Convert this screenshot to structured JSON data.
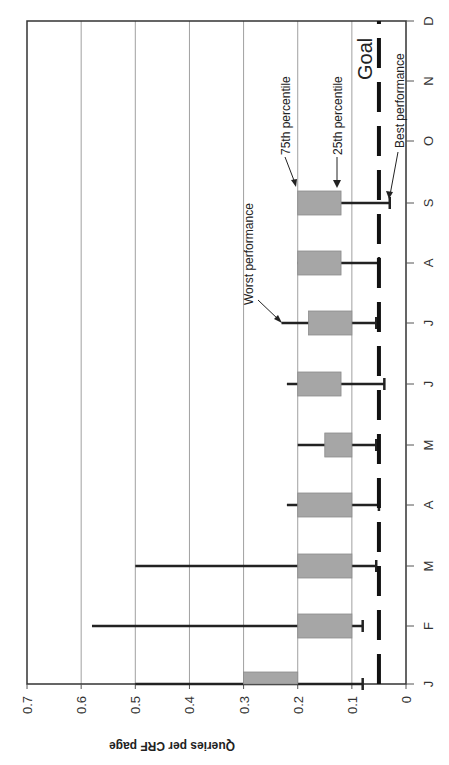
{
  "chart_data": {
    "type": "box",
    "orientation": "rotated-90-clockwise",
    "title": "",
    "xlabel": "",
    "ylabel": "Queries per CRF page",
    "ylim": [
      0,
      0.7
    ],
    "yticks": [
      "0",
      "0.1",
      "0.2",
      "0.3",
      "0.4",
      "0.5",
      "0.6",
      "0.7"
    ],
    "categories": [
      "J",
      "F",
      "M",
      "A",
      "M",
      "J",
      "J",
      "A",
      "S",
      "O",
      "N",
      "D"
    ],
    "grid": true,
    "series": [
      {
        "name": "25th percentile",
        "values": [
          0.2,
          0.1,
          0.1,
          0.1,
          0.1,
          0.12,
          0.1,
          0.12,
          0.12,
          null,
          null,
          null
        ]
      },
      {
        "name": "75th percentile",
        "values": [
          0.3,
          0.2,
          0.2,
          0.2,
          0.15,
          0.2,
          0.18,
          0.2,
          0.2,
          null,
          null,
          null
        ]
      },
      {
        "name": "Best performance",
        "values": [
          0.08,
          0.08,
          0.055,
          0.05,
          0.055,
          0.04,
          0.055,
          0.05,
          0.03,
          null,
          null,
          null
        ]
      },
      {
        "name": "Worst performance",
        "values": [
          0.5,
          0.58,
          0.5,
          0.22,
          0.2,
          0.22,
          0.23,
          0.2,
          0.12,
          null,
          null,
          null
        ]
      }
    ],
    "goal": {
      "label": "Goal",
      "value": 0.05,
      "style": "dashed"
    },
    "annotations": [
      "Worst performance",
      "75th percentile",
      "25th percentile",
      "Best performance",
      "Goal"
    ],
    "colors": {
      "box_fill": "#a6a6a6",
      "whisker": "#222222",
      "grid": "#a0a0a0",
      "goal_line": "#111111"
    }
  }
}
